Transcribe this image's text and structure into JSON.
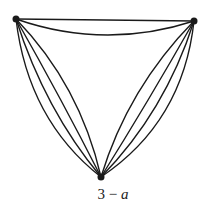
{
  "figure": {
    "caption_number": "3",
    "caption_separator": " − ",
    "caption_letter": "a",
    "graph": {
      "vertices": [
        {
          "id": "top-left",
          "x": 16,
          "y": 19
        },
        {
          "id": "top-right",
          "x": 194,
          "y": 21
        },
        {
          "id": "bottom",
          "x": 101,
          "y": 177
        }
      ],
      "edges": [
        {
          "from": "top-left",
          "to": "top-right",
          "multiplicity": 2
        },
        {
          "from": "top-left",
          "to": "bottom",
          "multiplicity": 4
        },
        {
          "from": "top-right",
          "to": "bottom",
          "multiplicity": 4
        }
      ],
      "stroke_color": "#1a1a1a"
    }
  }
}
